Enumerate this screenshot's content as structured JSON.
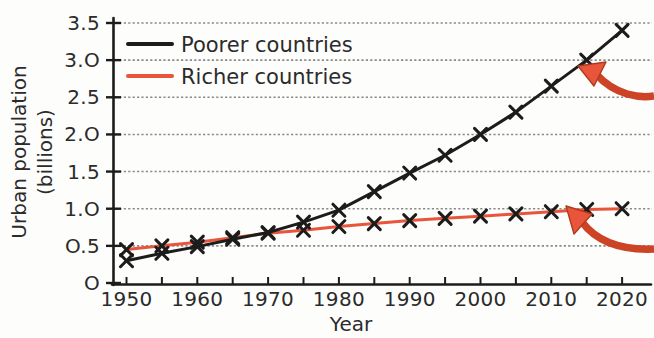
{
  "chart_data": {
    "type": "line",
    "title": "",
    "xlabel": "Year",
    "ylabel": "Urban population (billions)",
    "ylabel_line1": "Urban population",
    "ylabel_line2": "(billions)",
    "xlim": [
      1948,
      2023
    ],
    "ylim": [
      0,
      3.6
    ],
    "grid": true,
    "grid_axis": "y",
    "legend_position": "top-left",
    "x": [
      1950,
      1955,
      1960,
      1965,
      1970,
      1975,
      1980,
      1985,
      1990,
      1995,
      2000,
      2005,
      2010,
      2015,
      2020
    ],
    "xticks": [
      1950,
      1955,
      1960,
      1965,
      1970,
      1975,
      1980,
      1985,
      1990,
      1995,
      2000,
      2005,
      2010,
      2015,
      2020
    ],
    "xtick_labels": [
      "1950",
      "",
      "1960",
      "",
      "1970",
      "",
      "1980",
      "",
      "1990",
      "",
      "2000",
      "",
      "2010",
      "",
      "2020"
    ],
    "yticks": [
      0,
      0.5,
      1.0,
      1.5,
      2.0,
      2.5,
      3.0,
      3.5
    ],
    "ytick_labels": [
      "O",
      "O.5",
      "1.O",
      "1.5",
      "2.O",
      "2.5",
      "3.O",
      "3.5"
    ],
    "series": [
      {
        "name": "Poorer countries",
        "color": "#1c1c1c",
        "marker": "x",
        "values": [
          0.3,
          0.4,
          0.49,
          0.59,
          0.68,
          0.82,
          0.98,
          1.23,
          1.48,
          1.72,
          2.0,
          2.3,
          2.65,
          3.0,
          3.4
        ]
      },
      {
        "name": "Richer countries",
        "color": "#e8553a",
        "marker": "x",
        "values": [
          0.45,
          0.5,
          0.55,
          0.61,
          0.67,
          0.71,
          0.76,
          0.8,
          0.84,
          0.87,
          0.9,
          0.93,
          0.96,
          0.99,
          1.0
        ]
      }
    ],
    "annotations": [
      {
        "name": "arrow-to-poorer-line",
        "type": "curved-arrow",
        "color": "#cc4326",
        "points_to_year": 2015,
        "points_to_value": 3.0
      },
      {
        "name": "arrow-to-richer-line",
        "type": "curved-arrow",
        "color": "#cc4326",
        "points_to_year": 2015,
        "points_to_value": 1.0
      }
    ]
  },
  "legend": {
    "items": [
      {
        "label": "Poorer countries",
        "color": "#1c1c1c"
      },
      {
        "label": "Richer countries",
        "color": "#e8553a"
      }
    ]
  },
  "axis": {
    "x_title": "Year",
    "y_title_line1": "Urban population",
    "y_title_line2": "(billions)"
  },
  "ticks": {
    "y": [
      "3.5",
      "3.O",
      "2.5",
      "2.O",
      "1.5",
      "1.O",
      "O.5",
      "O"
    ],
    "x": [
      "1950",
      "1960",
      "1970",
      "1980",
      "1990",
      "2000",
      "2010",
      "2020"
    ]
  },
  "colors": {
    "poorer": "#1c1c1c",
    "richer": "#e8553a",
    "arrow": "#cc4326",
    "grid": "#888888",
    "axis": "#1c1c1c",
    "background": "#fdfdfc"
  }
}
